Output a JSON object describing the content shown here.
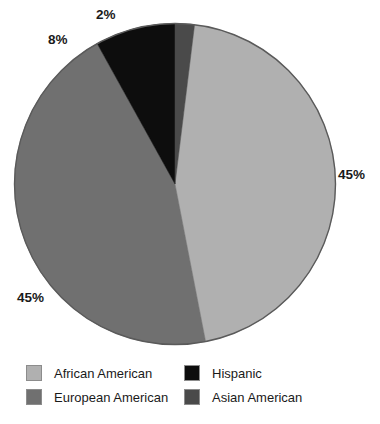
{
  "chart_data": {
    "type": "pie",
    "title": "",
    "subtitle": "",
    "xlabel": "",
    "ylabel": "",
    "grid": false,
    "legend_position": "bottom",
    "categories": [
      "African American",
      "European American",
      "Hispanic",
      "Asian American"
    ],
    "values": [
      45,
      45,
      8,
      2
    ],
    "value_labels": [
      "45%",
      "45%",
      "8%",
      "2%"
    ],
    "colors": [
      "#b0b0b0",
      "#707070",
      "#0d0d0d",
      "#4a4a4a"
    ],
    "slices": [
      {
        "label": "African American",
        "value": 45,
        "value_label": "45%",
        "color": "#b0b0b0",
        "start_angle": 7,
        "end_angle": 169
      },
      {
        "label": "European American",
        "value": 45,
        "value_label": "45%",
        "color": "#707070",
        "start_angle": 169,
        "end_angle": 331
      },
      {
        "label": "Hispanic",
        "value": 8,
        "value_label": "8%",
        "color": "#0d0d0d",
        "start_angle": 331,
        "end_angle": 360
      },
      {
        "label": "Asian American",
        "value": 2,
        "value_label": "2%",
        "color": "#4a4a4a",
        "start_angle": 0,
        "end_angle": 7
      }
    ],
    "annotations": [
      {
        "text": "2%",
        "x": 103,
        "y": 10
      },
      {
        "text": "8%",
        "x": 52,
        "y": 34
      },
      {
        "text": "45%",
        "x": 340,
        "y": 168
      },
      {
        "text": "45%",
        "x": 20,
        "y": 290
      }
    ]
  },
  "legend": {
    "items": [
      {
        "label": "African American",
        "color": "#b0b0b0"
      },
      {
        "label": "Hispanic",
        "color": "#0d0d0d"
      },
      {
        "label": "European American",
        "color": "#707070"
      },
      {
        "label": "Asian American",
        "color": "#4a4a4a"
      }
    ]
  },
  "style": {
    "background": "#ffffff",
    "outline": "#5a5a5a",
    "text": "#1a1a1a"
  }
}
